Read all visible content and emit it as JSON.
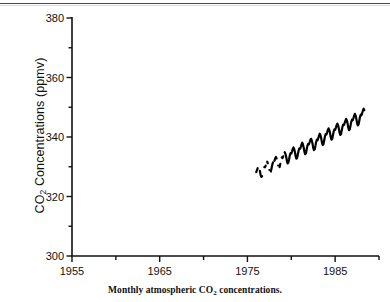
{
  "figure": {
    "caption_prefix": "Monthly atmospheric CO",
    "caption_sub": "2",
    "caption_suffix": " concentrations.",
    "ylabel_prefix": "CO",
    "ylabel_sub": "2",
    "ylabel_suffix": " Concentrations (ppmv)",
    "axis_color": "#111111",
    "series_color": "#000000",
    "background": "#ffffff"
  },
  "chart_data": {
    "type": "line",
    "title": "Monthly atmospheric CO2 concentrations.",
    "xlabel": "",
    "ylabel": "CO2 Concentrations (ppmv)",
    "xlim": [
      1955,
      1990
    ],
    "ylim": [
      300,
      380
    ],
    "xticks": [
      1955,
      1960,
      1965,
      1970,
      1975,
      1980,
      1985,
      1990
    ],
    "xticklabels": [
      "1955",
      "",
      "1965",
      "",
      "1975",
      "",
      "1985",
      ""
    ],
    "xtick_labeled": [
      1955,
      1965,
      1975,
      1985
    ],
    "yticks": [
      300,
      310,
      320,
      330,
      340,
      350,
      360,
      370,
      380
    ],
    "yticklabels": [
      "300",
      "",
      "320",
      "",
      "340",
      "",
      "360",
      "",
      "380"
    ],
    "ytick_labeled": [
      300,
      320,
      340,
      360,
      380
    ],
    "grid": false,
    "legend": false,
    "series": [
      {
        "name": "Monthly atmospheric CO2",
        "x": [
          1976.0,
          1976.08,
          1976.17,
          1976.25,
          1976.33,
          1976.42,
          1976.5,
          1976.58,
          1976.67,
          1976.75,
          1976.83,
          1976.92,
          1977.0,
          1977.08,
          1977.17,
          1977.25,
          1977.33,
          1977.42,
          1977.5,
          1977.58,
          1977.67,
          1977.75,
          1977.83,
          1977.92,
          1978.0,
          1978.08,
          1978.17,
          1978.25,
          1978.33,
          1978.42,
          1978.5,
          1978.58,
          1978.67,
          1978.75,
          1978.83,
          1978.92,
          1979.0,
          1979.08,
          1979.17,
          1979.25,
          1979.33,
          1979.42,
          1979.5,
          1979.58,
          1979.67,
          1979.75,
          1979.83,
          1979.92,
          1980.0,
          1980.08,
          1980.17,
          1980.25,
          1980.33,
          1980.42,
          1980.5,
          1980.58,
          1980.67,
          1980.75,
          1980.83,
          1980.92,
          1981.0,
          1981.08,
          1981.17,
          1981.25,
          1981.33,
          1981.42,
          1981.5,
          1981.58,
          1981.67,
          1981.75,
          1981.83,
          1981.92,
          1982.0,
          1982.08,
          1982.17,
          1982.25,
          1982.33,
          1982.42,
          1982.5,
          1982.58,
          1982.67,
          1982.75,
          1982.83,
          1982.92,
          1983.0,
          1983.08,
          1983.17,
          1983.25,
          1983.33,
          1983.42,
          1983.5,
          1983.58,
          1983.67,
          1983.75,
          1983.83,
          1983.92,
          1984.0,
          1984.08,
          1984.17,
          1984.25,
          1984.33,
          1984.42,
          1984.5,
          1984.58,
          1984.67,
          1984.75,
          1984.83,
          1984.92,
          1985.0,
          1985.08,
          1985.17,
          1985.25,
          1985.33,
          1985.42,
          1985.5,
          1985.58,
          1985.67,
          1985.75,
          1985.83,
          1985.92,
          1986.0,
          1986.08,
          1986.17,
          1986.25,
          1986.33,
          1986.42,
          1986.5,
          1986.58,
          1986.67,
          1986.75,
          1986.83,
          1986.92,
          1987.0,
          1987.08,
          1987.17,
          1987.25,
          1987.33,
          1987.42,
          1987.5,
          1987.58,
          1987.67,
          1987.75,
          1987.83,
          1987.92,
          1988.0,
          1988.08,
          1988.17,
          1988.25,
          1988.33
        ],
        "y": [
          328.2,
          328.8,
          329.5,
          330.0,
          329.6,
          328.6,
          327.3,
          326.6,
          326.8,
          327.9,
          329.1,
          329.9,
          329.8,
          330.4,
          331.2,
          331.7,
          331.2,
          330.2,
          328.9,
          328.1,
          328.4,
          329.5,
          330.7,
          331.5,
          331.3,
          332.0,
          332.8,
          333.3,
          332.8,
          331.8,
          330.4,
          329.6,
          329.9,
          331.0,
          332.2,
          333.1,
          332.9,
          333.5,
          334.4,
          334.9,
          334.4,
          333.3,
          332.0,
          331.1,
          331.4,
          332.5,
          333.8,
          334.6,
          334.4,
          335.1,
          336.0,
          336.5,
          336.0,
          334.9,
          333.5,
          332.7,
          333.0,
          334.2,
          335.4,
          336.2,
          336.0,
          336.6,
          337.5,
          338.1,
          337.5,
          336.4,
          335.0,
          334.2,
          334.5,
          335.7,
          336.9,
          337.7,
          337.5,
          338.1,
          338.9,
          339.4,
          338.9,
          337.8,
          336.4,
          335.6,
          335.9,
          337.0,
          338.3,
          339.1,
          338.9,
          339.6,
          340.5,
          341.1,
          340.6,
          339.5,
          338.1,
          337.3,
          337.6,
          338.8,
          340.1,
          341.0,
          340.8,
          341.5,
          342.4,
          342.9,
          342.4,
          341.3,
          339.9,
          339.1,
          339.4,
          340.6,
          341.8,
          342.6,
          342.4,
          343.1,
          344.0,
          344.5,
          344.0,
          342.9,
          341.5,
          340.7,
          341.0,
          342.2,
          343.4,
          344.2,
          344.0,
          344.7,
          345.5,
          346.1,
          345.6,
          344.5,
          343.1,
          342.3,
          342.6,
          343.8,
          345.0,
          345.8,
          345.6,
          346.3,
          347.2,
          347.8,
          347.2,
          346.1,
          344.7,
          343.9,
          344.2,
          345.4,
          346.7,
          347.5,
          347.3,
          348.0,
          348.9,
          349.5,
          349.0
        ]
      }
    ]
  }
}
